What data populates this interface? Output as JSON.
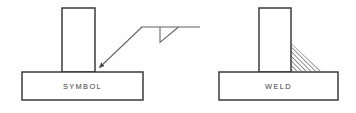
{
  "figure": {
    "background_color": "#fefefe",
    "line_color": "#3b3b3b",
    "hatch_color": "#55555a",
    "panels": [
      {
        "id": "symbol-panel",
        "caption": "SYMBOL",
        "description": "Tee joint drawn with a fillet weld symbol leader",
        "base_plate": {
          "x": 22,
          "y": 72,
          "width": 121,
          "height": 28
        },
        "vertical_plate": {
          "x": 62,
          "y": 8,
          "width": 33,
          "height": 64
        },
        "leader": {
          "name": "leader-line",
          "arrow_tip": {
            "x": 95,
            "y": 72
          },
          "elbow": {
            "x": 142,
            "y": 27
          }
        },
        "reference_line": {
          "x1": 142,
          "y1": 27,
          "x2": 200,
          "y2": 27
        },
        "weld_symbol": {
          "type": "fillet",
          "side": "arrow-side",
          "triangle": {
            "apex_top_left": {
              "x": 160,
              "y": 27
            },
            "bottom": {
              "x": 160,
              "y": 42
            },
            "apex_top_right": {
              "x": 178,
              "y": 27
            }
          }
        }
      },
      {
        "id": "weld-panel",
        "caption": "WELD",
        "description": "Tee joint showing the actual deposited fillet weld bead",
        "base_plate": {
          "x": 219,
          "y": 72,
          "width": 119,
          "height": 28
        },
        "vertical_plate": {
          "x": 259,
          "y": 8,
          "width": 32,
          "height": 64
        },
        "weld_bead": {
          "name": "fillet-weld-bead",
          "shape": "right-triangle-hatched",
          "vertical_leg": {
            "x": 291,
            "y_top": 44,
            "y_bottom": 72
          },
          "horizontal_leg": {
            "y": 72,
            "x_start": 291,
            "x_end": 320
          },
          "hatch_spacing_px": 2.3,
          "hatch_angle_deg": 45
        }
      }
    ],
    "captions": {
      "left_label": "SYMBOL",
      "right_label": "WELD"
    }
  }
}
